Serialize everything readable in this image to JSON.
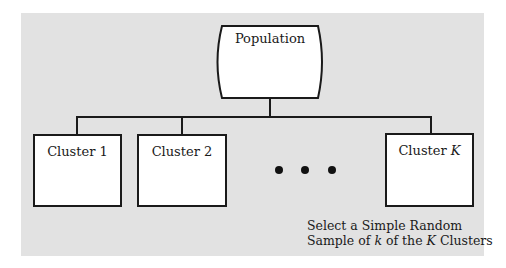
{
  "diagram": {
    "root": {
      "label": "Population"
    },
    "clusters": [
      {
        "label_prefix": "Cluster",
        "label_index": "1"
      },
      {
        "label_prefix": "Cluster",
        "label_index": "2"
      },
      {
        "label_prefix": "Cluster",
        "label_index": "K"
      }
    ],
    "ellipsis": "• • •",
    "caption": {
      "line1": "Select a Simple Random",
      "line2_a": "Sample of",
      "line2_k": "k",
      "line2_b": "of the",
      "line2_K": "K",
      "line2_c": "Clusters"
    },
    "colors": {
      "background": "#e2e2e2",
      "box_fill": "#ffffff",
      "stroke": "#1a1a1a"
    }
  }
}
